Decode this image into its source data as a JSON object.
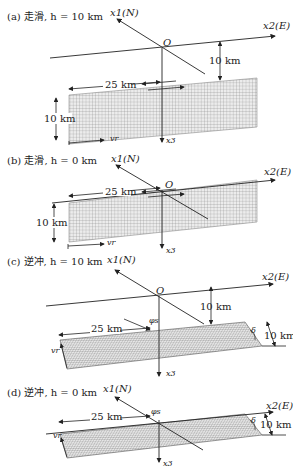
{
  "panels": [
    {
      "id": "a",
      "title": "(a) 走滑, h = 10 km",
      "axis_x1": "x1(N)",
      "axis_x2": "x2(E)",
      "axis_x3": "x3",
      "origin": "O",
      "depth_label": "10 km",
      "length_label": "25 km",
      "width_label": "10 km",
      "rupture_label": "vr"
    },
    {
      "id": "b",
      "title": "(b) 走滑, h = 0 km",
      "axis_x1": "x1(N)",
      "axis_x2": "x2(E)",
      "axis_x3": "x3",
      "origin": "O",
      "length_label": "25 km",
      "width_label": "10 km",
      "rupture_label": "vr"
    },
    {
      "id": "c",
      "title": "(c) 逆冲, h = 10 km",
      "axis_x1": "x1(N)",
      "axis_x2": "x2(E)",
      "axis_x3": "x3",
      "origin": "O",
      "depth_label": "10 km",
      "length_label": "25 km",
      "width_label": "10 km",
      "strike_label": "φs",
      "dip_label": "δ",
      "rupture_label": "vr"
    },
    {
      "id": "d",
      "title": "(d) 逆冲, h = 0 km",
      "axis_x1": "x1(N)",
      "axis_x2": "x2(E)",
      "axis_x3": "x3",
      "origin": "O",
      "length_label": "25 km",
      "width_label": "10 km",
      "strike_label": "φs",
      "dip_label": "δ",
      "rupture_label": "vr"
    }
  ],
  "colors": {
    "line": "#222222",
    "grid": "#9a9a9a",
    "background": "#ffffff"
  }
}
